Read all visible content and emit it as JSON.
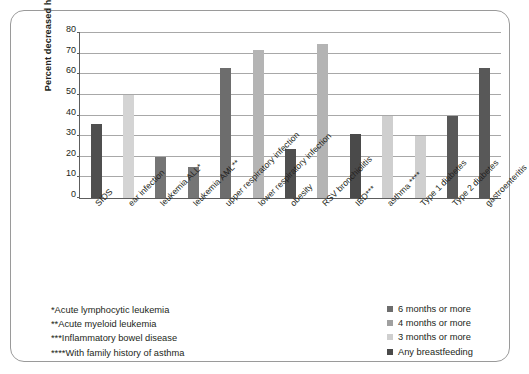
{
  "chart_data": {
    "type": "bar",
    "title": "",
    "xlabel": "",
    "ylabel": "Percent decreased heath risk",
    "ylim": [
      0,
      80
    ],
    "ytick_step": 10,
    "yticks": [
      0,
      10,
      20,
      30,
      40,
      50,
      60,
      70,
      80
    ],
    "grid": true,
    "legend_position": "bottom-right",
    "categories": [
      "SIDS",
      "ear infection",
      "leukemia ALL*",
      "leukemia AML**",
      "upper respiratory infection",
      "lower respiratory infection",
      "obesity",
      "RSV bronchiolitis",
      "IBD***",
      "asthma ****",
      "Type 1 diabetes",
      "Type 2 diabetes",
      "gastroenteritis"
    ],
    "values": [
      36,
      50,
      20,
      15,
      63,
      72,
      24,
      74.5,
      31,
      40,
      30,
      40,
      63
    ],
    "series_by_bar": [
      "Any breastfeeding",
      "3 months or more",
      "6 months or more",
      "6 months or more",
      "6 months or more",
      "4 months or more",
      "Any breastfeeding",
      "4 months or more",
      "Any breastfeeding",
      "3 months or more",
      "3 months or more",
      "Any breastfeeding",
      "Any breastfeeding"
    ],
    "bar_colors": [
      "#4f4f4f",
      "#d4d4d4",
      "#757575",
      "#757575",
      "#6d6d6d",
      "#b4b4b4",
      "#4f4f4f",
      "#b4b4b4",
      "#4a4a4a",
      "#cfcfcf",
      "#cfcfcf",
      "#585858",
      "#585858"
    ]
  },
  "legend": {
    "items": [
      {
        "label": "6 months or more",
        "color": "#6d6d6d"
      },
      {
        "label": "4 months or more",
        "color": "#a0a0a0"
      },
      {
        "label": "3 months or more",
        "color": "#cfcfcf"
      },
      {
        "label": "Any breastfeeding",
        "color": "#4a4a4a"
      }
    ]
  },
  "footnotes": {
    "lines": [
      "*Acute lymphocytic leukemia",
      "**Acute myeloid leukemia",
      "***Inflammatory bowel disease",
      "****With family history of asthma"
    ]
  }
}
